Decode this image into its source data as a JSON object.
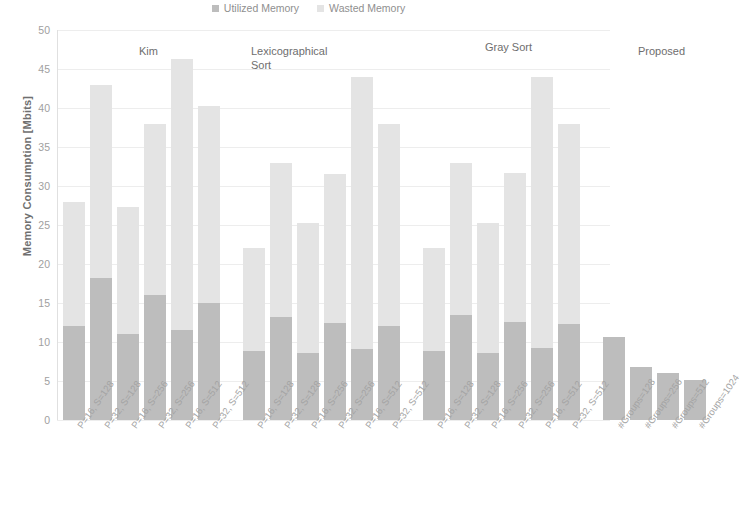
{
  "legend": {
    "position": "top-center",
    "entries": [
      {
        "label": "Utilized Memory",
        "color": "#bdbdbd"
      },
      {
        "label": "Wasted Memory",
        "color": "#e4e4e4"
      }
    ]
  },
  "axes": {
    "ylabel": "Memory Consumption [Mbits]",
    "yticks": [
      "0",
      "5",
      "10",
      "15",
      "20",
      "25",
      "30",
      "35",
      "40",
      "45",
      "50"
    ],
    "ymin": 0,
    "ymax": 50,
    "grid": true
  },
  "groups": [
    {
      "title": "Kim"
    },
    {
      "title": "Lexicographical\nSort"
    },
    {
      "title": "Gray Sort"
    },
    {
      "title": "Proposed"
    }
  ],
  "chart_data": {
    "type": "bar",
    "title": "",
    "xlabel": "",
    "ylabel": "Memory Consumption [Mbits]",
    "ylim": [
      0,
      50
    ],
    "ytick_step": 5,
    "grid": true,
    "stacked": true,
    "legend_position": "top-center",
    "series": [
      {
        "name": "Utilized Memory",
        "color": "#bdbdbd",
        "values": [
          12.0,
          18.2,
          11.0,
          16.0,
          11.6,
          15.0,
          8.8,
          13.2,
          8.6,
          12.4,
          9.1,
          12.0,
          8.9,
          13.4,
          8.6,
          12.6,
          9.2,
          12.3,
          10.6,
          6.8,
          6.0,
          5.1
        ]
      },
      {
        "name": "Wasted Memory",
        "color": "#e4e4e4",
        "values": [
          16.0,
          24.8,
          16.3,
          22.0,
          34.7,
          25.2,
          13.2,
          19.8,
          16.7,
          19.1,
          34.9,
          26.0,
          13.1,
          19.6,
          16.7,
          19.1,
          34.8,
          25.7,
          0,
          0,
          0,
          0
        ]
      }
    ],
    "totals": [
      28.0,
      43.0,
      27.3,
      38.0,
      46.3,
      40.2,
      22.0,
      33.0,
      25.3,
      31.5,
      44.0,
      38.0,
      22.0,
      33.0,
      25.3,
      31.7,
      44.0,
      38.0,
      10.6,
      6.8,
      6.0,
      5.1
    ],
    "categories": [
      "P=16, S=128",
      "P=32, S=128",
      "P=16, S=256",
      "P=32, S=256",
      "P=16, S=512",
      "P=32, S=512",
      "P=16, S=128",
      "P=32, S=128",
      "P=16, S=256",
      "P=32, S=256",
      "P=16, S=512",
      "P=32, S=512",
      "P=16, S=128",
      "P=32, S=128",
      "P=16, S=256",
      "P=32, S=256",
      "P=16, S=512",
      "P=32, S=512",
      "#Groups=128",
      "#Groups=256",
      "#Groups=512",
      "#Groups=1024"
    ],
    "group_labels": [
      "Kim",
      "Lexicographical Sort",
      "Gray Sort",
      "Proposed"
    ],
    "group_sizes": [
      6,
      6,
      6,
      4
    ]
  }
}
